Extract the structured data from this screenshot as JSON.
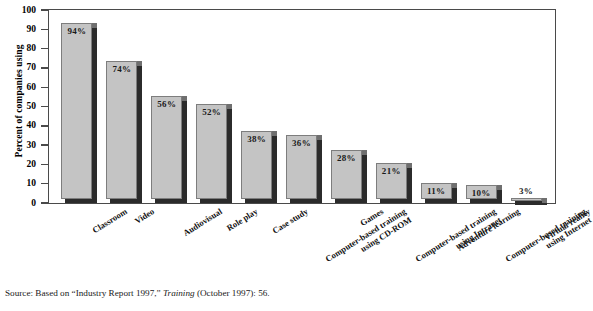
{
  "figure": {
    "source_prefix": "Source: Based on “Industry Report 1997,” ",
    "source_italic": "Training",
    "source_suffix": " (October 1997): 56."
  },
  "chart_data": {
    "type": "bar",
    "title": "",
    "subtitle": "",
    "xlabel": "",
    "ylabel": "Percent of companies using",
    "ylim": [
      0,
      100
    ],
    "yticks": [
      0,
      10,
      20,
      30,
      40,
      50,
      60,
      70,
      80,
      90,
      100
    ],
    "ytick_labels": [
      "0",
      "10",
      "20",
      "30",
      "40",
      "50",
      "60",
      "70",
      "80",
      "90",
      "100"
    ],
    "grid": false,
    "legend": false,
    "legend_position": "none",
    "orientation": "vertical",
    "bar_style": "3d-shadow",
    "colors": {
      "bar_face": "#c4c4c4",
      "bar_shadow": "#2b2b2b",
      "bar_edge": "#7d7d7d",
      "frame": "#4a4a4a",
      "text": "#111111",
      "background": "#ffffff"
    },
    "categories": [
      "Classroom",
      "Video",
      "Audiovisual",
      "Role play",
      "Case study",
      "Computer-based training using CD-ROM",
      "Games",
      "Computer-based training using Intranet",
      "Adventure learning",
      "Computer-based training using Internet",
      "Virtual reality"
    ],
    "category_lines": [
      [
        "Classroom"
      ],
      [
        "Video"
      ],
      [
        "Audiovisual"
      ],
      [
        "Role play"
      ],
      [
        "Case study"
      ],
      [
        "Computer-based training",
        "using CD-ROM"
      ],
      [
        "Games"
      ],
      [
        "Computer-based training",
        "using Intranet"
      ],
      [
        "Adventure learning"
      ],
      [
        "Computer-based training",
        "using Internet"
      ],
      [
        "Virtual reality"
      ]
    ],
    "values": [
      94,
      74,
      56,
      52,
      38,
      36,
      28,
      21,
      11,
      10,
      3
    ],
    "data_labels": [
      "94%",
      "74%",
      "56%",
      "52%",
      "38%",
      "36%",
      "28%",
      "21%",
      "11%",
      "10%",
      "3%"
    ]
  }
}
